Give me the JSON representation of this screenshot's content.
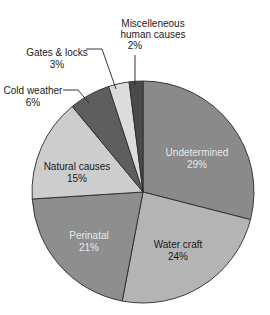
{
  "chart_data": {
    "type": "pie",
    "title": "",
    "start_angle_deg": 0,
    "direction": "clockwise",
    "slices": [
      {
        "label": "Undetermined",
        "value": 29,
        "display": "29%",
        "color": "#8a8a8a",
        "text_color": "#e8e8e8"
      },
      {
        "label": "Water craft",
        "value": 24,
        "display": "24%",
        "color": "#b4b4b4",
        "text_color": "#1a1a1a"
      },
      {
        "label": "Perinatal",
        "value": 21,
        "display": "21%",
        "color": "#8e8e8e",
        "text_color": "#e8e8e8"
      },
      {
        "label": "Natural causes",
        "value": 15,
        "display": "15%",
        "color": "#cdcdcd",
        "text_color": "#1a1a1a"
      },
      {
        "label": "Cold weather",
        "value": 6,
        "display": "6%",
        "color": "#5e5e5e",
        "text_color": "#1a1a1a"
      },
      {
        "label": "Gates & locks",
        "value": 3,
        "display": "3%",
        "color": "#dcdcdc",
        "text_color": "#1a1a1a"
      },
      {
        "label": "Miscelleneous human causes",
        "value": 2,
        "display": "2%",
        "color": "#4a4a4a",
        "text_color": "#1a1a1a"
      }
    ]
  },
  "labels": {
    "undetermined": {
      "name": "Undetermined",
      "pct": "29%"
    },
    "water_craft": {
      "name": "Water craft",
      "pct": "24%"
    },
    "perinatal": {
      "name": "Perinatal",
      "pct": "21%"
    },
    "natural_causes": {
      "name": "Natural causes",
      "pct": "15%"
    },
    "cold_weather": {
      "name": "Cold weather",
      "pct": "6%"
    },
    "gates_locks": {
      "name": "Gates & locks",
      "pct": "3%"
    },
    "misc": {
      "line1": "Miscelleneous",
      "line2": "human causes",
      "pct": "2%"
    }
  }
}
